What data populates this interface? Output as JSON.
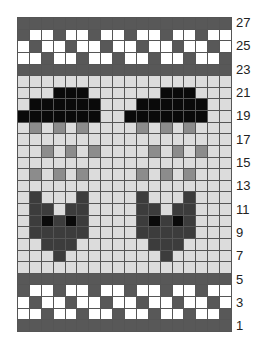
{
  "caption": "",
  "palette": {
    "D": "#585858",
    "W": "#ffffff",
    "L": "#dcdcdc",
    "M": "#8c8c8c",
    "F": "#3c3c3c",
    "K": "#0a0a0a"
  },
  "legend": {
    "D": "dark gray (border bands)",
    "W": "white",
    "L": "light gray (background)",
    "M": "medium gray (rain)",
    "F": "charcoal (fox)",
    "K": "black (cloud / fox eyes)"
  },
  "grid": {
    "columns": 18,
    "rows": 27,
    "row_labels": [
      "27",
      "25",
      "23",
      "21",
      "19",
      "17",
      "15",
      "13",
      "11",
      "9",
      "7",
      "5",
      "3",
      "1"
    ],
    "rows_top_to_bottom": [
      "DDDDDDDDDDDDDDDDDD",
      "DWWDWWDWWDWWDWWDWW",
      "WDWWDWWDWWDWWDWWDW",
      "WWDWWDWWDWWDWWDWWD",
      "DDDDDDDDDDDDDDDDDD",
      "LLLLLLLLLLLLLLLLLL",
      "LLLKKKLLLLLLKKKLLL",
      "LKKKKKKLLLKKKKKKLL",
      "KKKKKKKLLKKKKKKKLL",
      "LMLMLMLLLLMLMLMLLL",
      "LLLLLLLLLLLLLLLLLL",
      "LLMLMLMLLLLMLMLMLL",
      "LLLLLLLLLLLLLLLLLL",
      "LMLMLMLLLLMLMLMLLL",
      "LLLLLLLLLLLLLLLLLL",
      "LFLLLFLLLLFLLLFLLL",
      "LFFLFFLLLLFFLFFLLL",
      "LFKFKFLLLLFKFKFLLL",
      "LFFFFFLLLLFFFFFLLL",
      "LLFFFLLLLLLFFFLLLL",
      "LLLFLLLLLLLLFLLLLL",
      "LLLLLLLLLLLLLLLLLL",
      "DDDDDDDDDDDDDDDDDD",
      "DWWDWWDWWDWWDWWDWW",
      "WDWWDWWDWWDWWDWWDW",
      "WWDWWDWWDWWDWWDWWD",
      "DDDDDDDDDDDDDDDDDD"
    ]
  }
}
